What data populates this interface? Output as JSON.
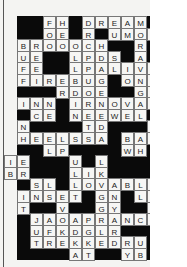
{
  "puzzle": {
    "type": "crossword",
    "cell_size": 13,
    "origin": [
      17,
      16
    ],
    "cells": [
      {
        "r": 0,
        "c": 3,
        "t": "F"
      },
      {
        "r": 0,
        "c": 4,
        "t": "H"
      },
      {
        "r": 0,
        "c": 6,
        "t": "D"
      },
      {
        "r": 0,
        "c": 7,
        "t": "R"
      },
      {
        "r": 0,
        "c": 8,
        "t": "E"
      },
      {
        "r": 0,
        "c": 9,
        "t": "A"
      },
      {
        "r": 0,
        "c": 10,
        "t": "M"
      },
      {
        "r": 1,
        "c": 3,
        "t": "O"
      },
      {
        "r": 1,
        "c": 4,
        "t": "E"
      },
      {
        "r": 1,
        "c": 6,
        "t": "R"
      },
      {
        "r": 1,
        "c": 8,
        "t": "U"
      },
      {
        "r": 1,
        "c": 9,
        "t": "M"
      },
      {
        "r": 1,
        "c": 10,
        "t": "O"
      },
      {
        "r": 1,
        "c": 11,
        "t": "E"
      },
      {
        "r": 2,
        "c": 1,
        "t": "B"
      },
      {
        "r": 2,
        "c": 2,
        "t": "R"
      },
      {
        "r": 2,
        "c": 3,
        "t": "O"
      },
      {
        "r": 2,
        "c": 4,
        "t": "O"
      },
      {
        "r": 2,
        "c": 5,
        "t": "O"
      },
      {
        "r": 2,
        "c": 6,
        "t": "C"
      },
      {
        "r": 2,
        "c": 7,
        "t": "H"
      },
      {
        "r": 2,
        "c": 10,
        "t": "R"
      },
      {
        "r": 3,
        "c": 1,
        "t": "U"
      },
      {
        "r": 3,
        "c": 2,
        "t": "E"
      },
      {
        "r": 3,
        "c": 5,
        "t": "L"
      },
      {
        "r": 3,
        "c": 6,
        "t": "P"
      },
      {
        "r": 3,
        "c": 6,
        "t": ""
      },
      {
        "r": 3,
        "c": 7,
        "t": "D"
      },
      {
        "r": 3,
        "c": 8,
        "t": "S"
      },
      {
        "r": 3,
        "c": 10,
        "t": "A"
      },
      {
        "r": 4,
        "c": 1,
        "t": "F"
      },
      {
        "r": 4,
        "c": 2,
        "t": "E"
      },
      {
        "r": 4,
        "c": 5,
        "t": "L"
      },
      {
        "r": 4,
        "c": 6,
        "t": "P"
      },
      {
        "r": 4,
        "c": 7,
        "t": "A"
      },
      {
        "r": 4,
        "c": 8,
        "t": "L"
      },
      {
        "r": 4,
        "c": 9,
        "t": "I"
      },
      {
        "r": 4,
        "c": 10,
        "t": "V"
      },
      {
        "r": 4,
        "c": 11,
        "t": "E"
      },
      {
        "r": 5,
        "c": 1,
        "t": "F"
      },
      {
        "r": 5,
        "c": 2,
        "t": "I"
      },
      {
        "r": 5,
        "c": 3,
        "t": "R"
      },
      {
        "r": 5,
        "c": 4,
        "t": "E"
      },
      {
        "r": 5,
        "c": 5,
        "t": "B"
      },
      {
        "r": 5,
        "c": 6,
        "t": "U"
      },
      {
        "r": 5,
        "c": 7,
        "t": "G"
      },
      {
        "r": 5,
        "c": 9,
        "t": "O"
      },
      {
        "r": 5,
        "c": 10,
        "t": "N"
      },
      {
        "r": 5,
        "c": 11,
        "t": "E"
      },
      {
        "r": 6,
        "c": 4,
        "t": "R"
      },
      {
        "r": 6,
        "c": 5,
        "t": "D"
      },
      {
        "r": 6,
        "c": 6,
        "t": "O"
      },
      {
        "r": 6,
        "c": 7,
        "t": "E"
      },
      {
        "r": 6,
        "c": 10,
        "t": "G"
      },
      {
        "r": 6,
        "c": 11,
        "t": "V"
      },
      {
        "r": 7,
        "c": 1,
        "t": "I"
      },
      {
        "r": 7,
        "c": 2,
        "t": "N"
      },
      {
        "r": 7,
        "c": 3,
        "t": "N"
      },
      {
        "r": 7,
        "c": 5,
        "t": "I"
      },
      {
        "r": 7,
        "c": 6,
        "t": "R"
      },
      {
        "r": 7,
        "c": 7,
        "t": "N"
      },
      {
        "r": 7,
        "c": 8,
        "t": "O"
      },
      {
        "r": 7,
        "c": 9,
        "t": "V"
      },
      {
        "r": 7,
        "c": 10,
        "t": "A"
      },
      {
        "r": 7,
        "c": 11,
        "t": "E"
      },
      {
        "r": 8,
        "c": 2,
        "t": "C"
      },
      {
        "r": 8,
        "c": 3,
        "t": "E"
      },
      {
        "r": 8,
        "c": 5,
        "t": "N"
      },
      {
        "r": 8,
        "c": 6,
        "t": "E"
      },
      {
        "r": 8,
        "c": 7,
        "t": "E"
      },
      {
        "r": 8,
        "c": 8,
        "t": "W"
      },
      {
        "r": 8,
        "c": 9,
        "t": "E"
      },
      {
        "r": 8,
        "c": 10,
        "t": "L"
      },
      {
        "r": 9,
        "c": 1,
        "t": "N"
      },
      {
        "r": 9,
        "c": 6,
        "t": "T"
      },
      {
        "r": 9,
        "c": 7,
        "t": "D"
      },
      {
        "r": 9,
        "c": 11,
        "t": "L"
      },
      {
        "r": 10,
        "c": 1,
        "t": "H"
      },
      {
        "r": 10,
        "c": 2,
        "t": "E"
      },
      {
        "r": 10,
        "c": 3,
        "t": "E"
      },
      {
        "r": 10,
        "c": 4,
        "t": "L"
      },
      {
        "r": 10,
        "c": 5,
        "t": "S"
      },
      {
        "r": 10,
        "c": 6,
        "t": "S"
      },
      {
        "r": 10,
        "c": 7,
        "t": "A"
      },
      {
        "r": 10,
        "c": 9,
        "t": "B"
      },
      {
        "r": 10,
        "c": 10,
        "t": "A"
      },
      {
        "r": 10,
        "c": 11,
        "t": "Y"
      },
      {
        "r": 11,
        "c": 3,
        "t": "L"
      },
      {
        "r": 11,
        "c": 4,
        "t": "P"
      },
      {
        "r": 11,
        "c": 9,
        "t": "W"
      },
      {
        "r": 11,
        "c": 10,
        "t": "H"
      },
      {
        "r": 12,
        "c": 0,
        "t": "I"
      },
      {
        "r": 12,
        "c": 1,
        "t": "E"
      },
      {
        "r": 12,
        "c": 5,
        "t": "U"
      },
      {
        "r": 12,
        "c": 7,
        "t": "L"
      },
      {
        "r": 13,
        "c": 0,
        "t": "B"
      },
      {
        "r": 13,
        "c": 1,
        "t": "R"
      },
      {
        "r": 13,
        "c": 5,
        "t": "L"
      },
      {
        "r": 13,
        "c": 6,
        "t": "I"
      },
      {
        "r": 13,
        "c": 7,
        "t": "K"
      },
      {
        "r": 14,
        "c": 2,
        "t": "S"
      },
      {
        "r": 14,
        "c": 3,
        "t": "L"
      },
      {
        "r": 14,
        "c": 5,
        "t": "L"
      },
      {
        "r": 14,
        "c": 6,
        "t": "O"
      },
      {
        "r": 14,
        "c": 7,
        "t": "V"
      },
      {
        "r": 14,
        "c": 8,
        "t": "A"
      },
      {
        "r": 14,
        "c": 9,
        "t": "B"
      },
      {
        "r": 14,
        "c": 10,
        "t": "L"
      },
      {
        "r": 14,
        "c": 11,
        "t": "E"
      },
      {
        "r": 15,
        "c": 1,
        "t": "I"
      },
      {
        "r": 15,
        "c": 2,
        "t": "N"
      },
      {
        "r": 15,
        "c": 3,
        "t": "S"
      },
      {
        "r": 15,
        "c": 4,
        "t": "E"
      },
      {
        "r": 15,
        "c": 5,
        "t": "T"
      },
      {
        "r": 15,
        "c": 7,
        "t": "G"
      },
      {
        "r": 15,
        "c": 8,
        "t": "N"
      },
      {
        "r": 15,
        "c": 10,
        "t": "L"
      },
      {
        "r": 15,
        "c": 11,
        "t": "A"
      },
      {
        "r": 15,
        "c": 12,
        "t": "S"
      },
      {
        "r": 16,
        "c": 1,
        "t": "T"
      },
      {
        "r": 16,
        "c": 4,
        "t": "V"
      },
      {
        "r": 16,
        "c": 7,
        "t": "G"
      },
      {
        "r": 16,
        "c": 8,
        "t": "Y"
      },
      {
        "r": 16,
        "c": 11,
        "t": "S"
      },
      {
        "r": 16,
        "c": 12,
        "t": "S"
      },
      {
        "r": 17,
        "c": 2,
        "t": "J"
      },
      {
        "r": 17,
        "c": 3,
        "t": "A"
      },
      {
        "r": 17,
        "c": 4,
        "t": "O"
      },
      {
        "r": 17,
        "c": 5,
        "t": "A"
      },
      {
        "r": 17,
        "c": 6,
        "t": "P"
      },
      {
        "r": 17,
        "c": 7,
        "t": "R"
      },
      {
        "r": 17,
        "c": 8,
        "t": "A"
      },
      {
        "r": 17,
        "c": 9,
        "t": "N"
      },
      {
        "r": 17,
        "c": 10,
        "t": "C"
      },
      {
        "r": 17,
        "c": 11,
        "t": "E"
      },
      {
        "r": 18,
        "c": 2,
        "t": "U"
      },
      {
        "r": 18,
        "c": 3,
        "t": "F"
      },
      {
        "r": 18,
        "c": 4,
        "t": "K"
      },
      {
        "r": 18,
        "c": 5,
        "t": "D"
      },
      {
        "r": 18,
        "c": 6,
        "t": "G"
      },
      {
        "r": 18,
        "c": 7,
        "t": "L"
      },
      {
        "r": 18,
        "c": 8,
        "t": "R"
      },
      {
        "r": 19,
        "c": 2,
        "t": "T"
      },
      {
        "r": 19,
        "c": 3,
        "t": "R"
      },
      {
        "r": 19,
        "c": 4,
        "t": "E"
      },
      {
        "r": 19,
        "c": 5,
        "t": "K"
      },
      {
        "r": 19,
        "c": 6,
        "t": "K"
      },
      {
        "r": 19,
        "c": 7,
        "t": "E"
      },
      {
        "r": 19,
        "c": 8,
        "t": "D"
      },
      {
        "r": 19,
        "c": 9,
        "t": "R"
      },
      {
        "r": 19,
        "c": 10,
        "t": "U"
      },
      {
        "r": 20,
        "c": 5,
        "t": "A"
      },
      {
        "r": 20,
        "c": 6,
        "t": "T"
      },
      {
        "r": 20,
        "c": 9,
        "t": "Y"
      },
      {
        "r": 20,
        "c": 10,
        "t": "B"
      }
    ]
  }
}
